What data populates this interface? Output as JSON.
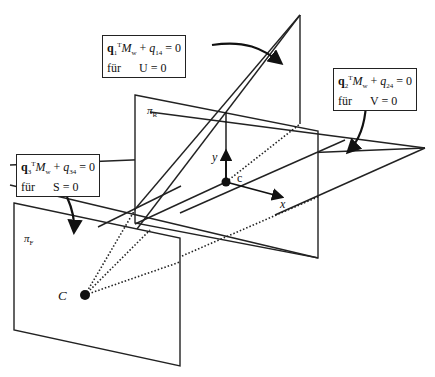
{
  "diagram": {
    "planes": {
      "pi_R": {
        "label": "π",
        "sub": "R"
      },
      "pi_F": {
        "label": "π",
        "sub": "F"
      }
    },
    "points": {
      "camera_center": "C",
      "principal_point": "c"
    },
    "axes": {
      "x": "x",
      "y": "y"
    },
    "equations": [
      {
        "vec": "q",
        "vec_sub": "1",
        "sup": "T",
        "M": "M",
        "M_sub": "w",
        "plus": "+",
        "q": "q",
        "q_sub": "14",
        "rhs": "= 0",
        "fuer": "für",
        "cond": "U = 0"
      },
      {
        "vec": "q",
        "vec_sub": "2",
        "sup": "T",
        "M": "M",
        "M_sub": "w",
        "plus": "+",
        "q": "q",
        "q_sub": "24",
        "rhs": "= 0",
        "fuer": "für",
        "cond": "V = 0"
      },
      {
        "vec": "q",
        "vec_sub": "3",
        "sup": "T",
        "M": "M",
        "M_sub": "w",
        "plus": "+",
        "q": "q",
        "q_sub": "34",
        "rhs": "= 0",
        "fuer": "für",
        "cond": "S = 0"
      }
    ]
  }
}
